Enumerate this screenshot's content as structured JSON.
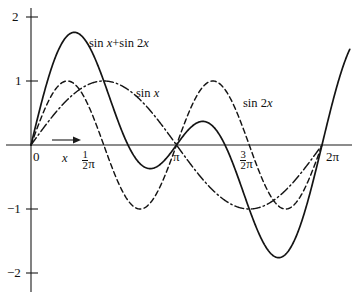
{
  "chart_data": {
    "type": "line",
    "title": "",
    "subtitle": "",
    "xlabel": "x",
    "ylabel": "",
    "xlim": [
      0,
      6.283185307
    ],
    "ylim": [
      -2.35,
      2.25
    ],
    "grid": false,
    "legend_position": "inline-annotations",
    "x_tick_labels": [
      "0",
      "½π",
      "π",
      "3/2π",
      "2π"
    ],
    "x_tick_values": [
      0,
      1.570796327,
      3.141592654,
      4.71238898,
      6.283185307
    ],
    "y_tick_labels": [
      "2",
      "1",
      "−1",
      "−2"
    ],
    "y_tick_values": [
      2,
      1,
      -1,
      -2
    ],
    "series": [
      {
        "name": "sin x+sin 2x",
        "style": "solid",
        "formula": "sin(x) + sin(2x)",
        "amplitude_max": 1.7602,
        "amplitude_min": -1.7602,
        "x": [
          0,
          0.3142,
          0.6283,
          0.9425,
          1.2566,
          1.5708,
          1.885,
          2.1991,
          2.5133,
          2.8274,
          3.1416,
          3.4558,
          3.7699,
          4.0841,
          4.3982,
          4.7124,
          5.0265,
          5.3407,
          5.6549,
          5.969,
          6.2832
        ],
        "values": [
          0,
          0.8968,
          1.5388,
          1.7601,
          1.5388,
          1.0,
          0.3633,
          -0.1626,
          -0.3633,
          -0.2511,
          0,
          0.2511,
          0.3633,
          0.1626,
          -0.3633,
          -1.0,
          -1.5388,
          -1.7601,
          -1.5388,
          -0.8968,
          0
        ]
      },
      {
        "name": "sin x",
        "style": "dash-dot",
        "formula": "sin(x)",
        "amplitude_max": 1,
        "amplitude_min": -1,
        "x": [
          0,
          0.3927,
          0.7854,
          1.1781,
          1.5708,
          1.9635,
          2.3562,
          2.7489,
          3.1416,
          3.5343,
          3.927,
          4.3197,
          4.7124,
          5.1051,
          5.4978,
          5.8905,
          6.2832
        ],
        "values": [
          0,
          0.3827,
          0.7071,
          0.9239,
          1.0,
          0.9239,
          0.7071,
          0.3827,
          0,
          -0.3827,
          -0.7071,
          -0.9239,
          -1.0,
          -0.9239,
          -0.7071,
          -0.3827,
          0
        ]
      },
      {
        "name": "sin 2x",
        "style": "dashed",
        "formula": "sin(2x)",
        "amplitude_max": 1,
        "amplitude_min": -1,
        "x": [
          0,
          0.3927,
          0.7854,
          1.1781,
          1.5708,
          1.9635,
          2.3562,
          2.7489,
          3.1416,
          3.5343,
          3.927,
          4.3197,
          4.7124,
          5.1051,
          5.4978,
          5.8905,
          6.2832
        ],
        "values": [
          0,
          0.7071,
          1.0,
          0.7071,
          0,
          -0.7071,
          -1.0,
          -0.7071,
          0,
          0.7071,
          1.0,
          0.7071,
          0,
          -0.7071,
          -1.0,
          -0.7071,
          0
        ]
      }
    ],
    "annotations": [
      {
        "text": "sin x+sin 2x",
        "at_x": 0.95,
        "at_y": 1.6
      },
      {
        "text": "sin x",
        "at_x": 2.25,
        "at_y": 0.82
      },
      {
        "text": "sin 2x",
        "at_x": 4.58,
        "at_y": 0.64
      }
    ]
  },
  "axes": {
    "y_ticks": [
      {
        "id": "y-tick-2",
        "label": "2",
        "value": 2
      },
      {
        "id": "y-tick-1",
        "label": "1",
        "value": 1
      },
      {
        "id": "y-tick-neg1",
        "label": "−1",
        "value": -1
      },
      {
        "id": "y-tick-neg2",
        "label": "−2",
        "value": -2
      }
    ],
    "x_ticks": [
      {
        "id": "x-tick-0",
        "label": "0",
        "value": 0
      },
      {
        "id": "x-tick-half-pi",
        "label_num": "1",
        "label_den": "2",
        "label_sym": "π",
        "value": 1.570796327
      },
      {
        "id": "x-tick-pi",
        "label_sym": "π",
        "value": 3.141592654
      },
      {
        "id": "x-tick-three-half-pi",
        "label_num": "3",
        "label_den": "2",
        "label_sym": "π",
        "value": 4.71238898
      },
      {
        "id": "x-tick-two-pi",
        "label": "2π",
        "value": 6.283185307
      }
    ],
    "x_axis_variable": "x"
  },
  "curve_labels": {
    "sum": "sin x+sin 2x",
    "sum_plain": "sin",
    "sum_var": "x",
    "sum_op": "+sin 2",
    "sum_var2": "x",
    "sinx_fn": "sin",
    "sinx_var": "x",
    "sin2x_fn": "sin 2",
    "sin2x_var": "x"
  },
  "colors": {
    "ink": "#141414",
    "axis": "#1a1a1a",
    "background": "#ffffff"
  }
}
